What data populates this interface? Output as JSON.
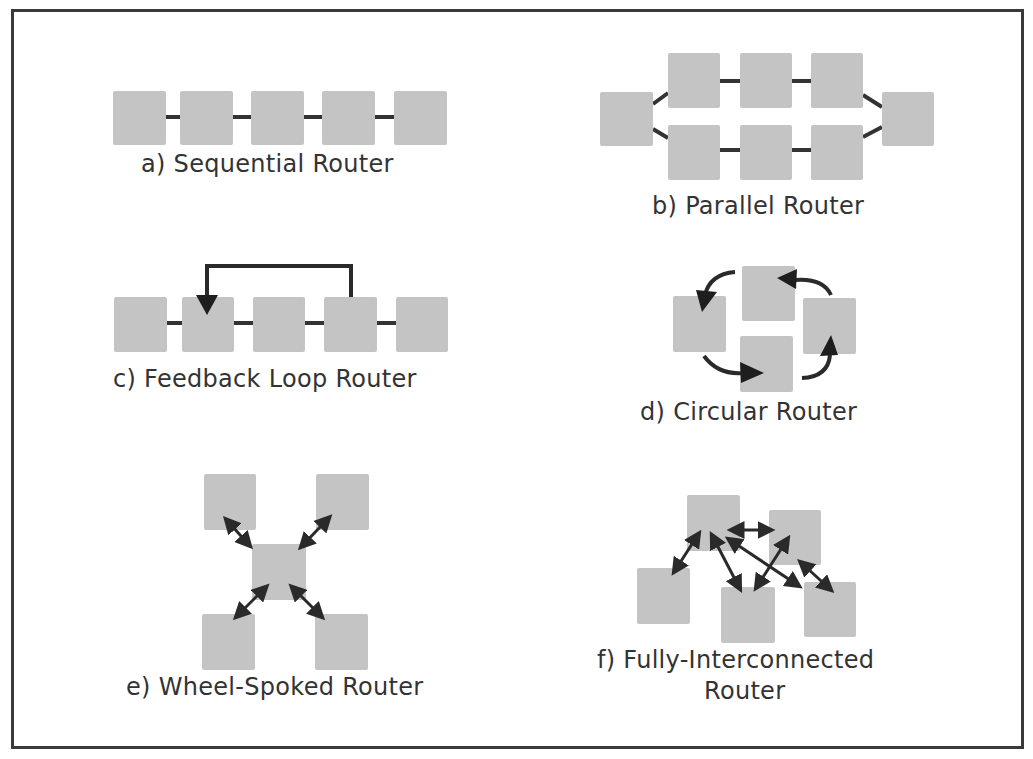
{
  "figure": {
    "panels": [
      {
        "id": "a",
        "label": "a)  Sequential Router",
        "node_count": 5
      },
      {
        "id": "b",
        "label": "b)  Parallel Router",
        "node_count": 8
      },
      {
        "id": "c",
        "label": "c)  Feedback Loop Router",
        "node_count": 5
      },
      {
        "id": "d",
        "label": "d)  Circular Router",
        "node_count": 4
      },
      {
        "id": "e",
        "label": "e)  Wheel-Spoked Router",
        "node_count": 5
      },
      {
        "id": "f",
        "label_line1": "f)  Fully-Interconnected",
        "label_line2": "Router",
        "node_count": 5
      }
    ],
    "colors": {
      "node_fill": "#c4c4c4",
      "connector": "#333333",
      "frame": "#3a3a3a",
      "text": "#333333"
    }
  }
}
